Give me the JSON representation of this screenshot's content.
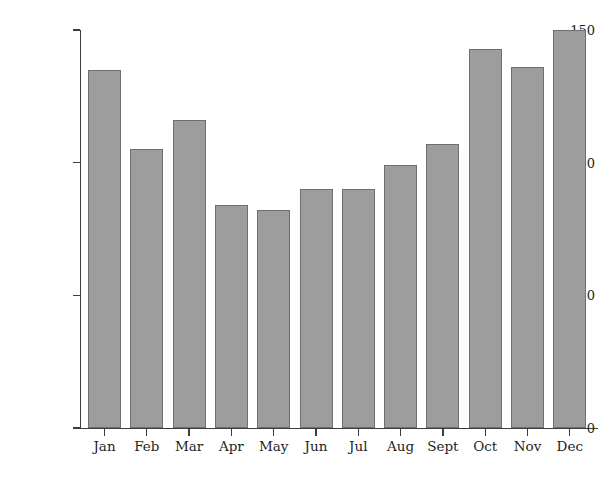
{
  "chart_data": {
    "type": "bar",
    "title": "",
    "xlabel": "",
    "ylabel": "Average rainfall (mm)",
    "categories": [
      "Jan",
      "Feb",
      "Mar",
      "Apr",
      "May",
      "Jun",
      "Jul",
      "Aug",
      "Sept",
      "Oct",
      "Nov",
      "Dec"
    ],
    "values": [
      135,
      105,
      116,
      84,
      82,
      90,
      90,
      99,
      107,
      143,
      136,
      150
    ],
    "ylim": [
      0,
      150
    ],
    "yticks": [
      0,
      50,
      100,
      150
    ],
    "ytick_labels": [
      "0",
      "50",
      "100",
      "150"
    ],
    "grid": false,
    "legend": null,
    "bar_color": "#9d9d9d",
    "bar_edge_color": "#6f6f6f",
    "axis_color": "#3d3d3d",
    "background": "#ffffff"
  }
}
